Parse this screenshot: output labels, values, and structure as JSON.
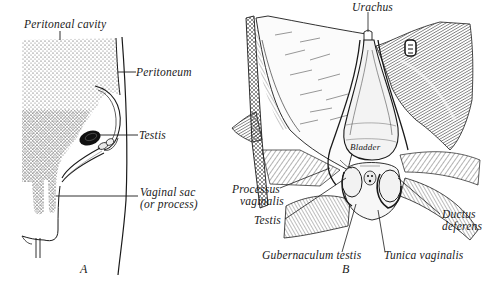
{
  "figure": {
    "panels": [
      {
        "id": "A",
        "letter": "A",
        "labels": {
          "peritoneal_cavity": "Peritoneal cavity",
          "peritoneum": "Peritoneum",
          "testis": "Testis",
          "vaginal_sac_line1": "Vaginal sac",
          "vaginal_sac_line2": "(or process)"
        }
      },
      {
        "id": "B",
        "letter": "B",
        "labels": {
          "urachus": "Urachus",
          "bladder": "Bladder",
          "processus_vaginalis_line1": "Processus",
          "processus_vaginalis_line2": "vaginalis",
          "testis": "Testis",
          "ductus_deferens_line1": "Ductus",
          "ductus_deferens_line2": "deferens",
          "gubernaculum_testis": "Gubernaculum testis",
          "tunica_vaginalis": "Tunica vaginalis"
        }
      }
    ],
    "colors": {
      "ink": "#1a1a1a",
      "paper": "#ffffff",
      "stipple": "#3a3a3a"
    }
  }
}
